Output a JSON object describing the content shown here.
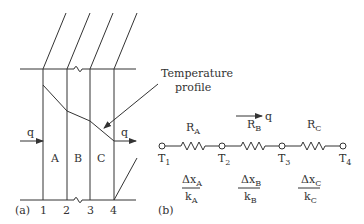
{
  "figure_a": {
    "label": "(a)",
    "layers": [
      "A",
      "B",
      "C"
    ],
    "interfaces": [
      "1",
      "2",
      "3",
      "4"
    ],
    "heat_flow_in": "q",
    "heat_flow_out": "q",
    "annotation_line1": "Temperature",
    "annotation_line2": "profile"
  },
  "figure_b": {
    "label": "(b)",
    "heat_flow": "q",
    "resistors": [
      {
        "name": "R",
        "sub": "A",
        "num": "Δx",
        "num_sub": "A",
        "den": "k",
        "den_sub": "A"
      },
      {
        "name": "R",
        "sub": "B",
        "num": "Δx",
        "num_sub": "B",
        "den": "k",
        "den_sub": "B"
      },
      {
        "name": "R",
        "sub": "C",
        "num": "Δx",
        "num_sub": "C",
        "den": "k",
        "den_sub": "C"
      }
    ],
    "nodes": [
      {
        "name": "T",
        "sub": "1"
      },
      {
        "name": "T",
        "sub": "2"
      },
      {
        "name": "T",
        "sub": "3"
      },
      {
        "name": "T",
        "sub": "4"
      }
    ]
  },
  "colors": {
    "line": "#333333",
    "background": "#ffffff"
  }
}
